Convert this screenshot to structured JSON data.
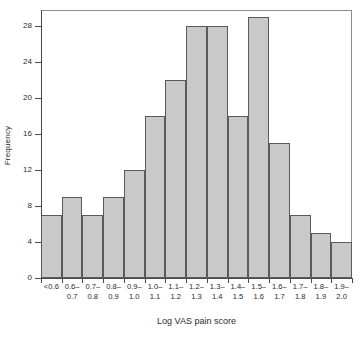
{
  "chart_data": {
    "type": "bar",
    "title": "",
    "xlabel": "Log VAS pain score",
    "ylabel": "Frequency",
    "categories": [
      "<0.6",
      "0.6-0.7",
      "0.7-0.8",
      "0.8-0.9",
      "0.9-1.0",
      "1.0-1.1",
      "1.1-1.2",
      "1.2-1.3",
      "1.3-1.4",
      "1.4-1.5",
      "1.5-1.6",
      "1.6-1.7",
      "1.7-1.8",
      "1.8-1.9",
      "1.9-2.0"
    ],
    "category_lines": [
      {
        "l1": "<0.6",
        "l2": ""
      },
      {
        "l1": "0.6–",
        "l2": "0.7"
      },
      {
        "l1": "0.7–",
        "l2": "0.8"
      },
      {
        "l1": "0.8–",
        "l2": "0.9"
      },
      {
        "l1": "0.9–",
        "l2": "1.0"
      },
      {
        "l1": "1.0–",
        "l2": "1.1"
      },
      {
        "l1": "1.1–",
        "l2": "1.2"
      },
      {
        "l1": "1.2–",
        "l2": "1.3"
      },
      {
        "l1": "1.3–",
        "l2": "1.4"
      },
      {
        "l1": "1.4–",
        "l2": "1.5"
      },
      {
        "l1": "1.5–",
        "l2": "1.6"
      },
      {
        "l1": "1.6–",
        "l2": "1.7"
      },
      {
        "l1": "1.7–",
        "l2": "1.8"
      },
      {
        "l1": "1.8–",
        "l2": "1.9"
      },
      {
        "l1": "1.9–",
        "l2": "2.0"
      }
    ],
    "values": [
      7,
      9,
      7,
      9,
      12,
      18,
      22,
      28,
      28,
      18,
      29,
      15,
      7,
      5,
      4
    ],
    "ylim": [
      0,
      29.8
    ],
    "yticks": [
      0,
      4,
      8,
      12,
      16,
      20,
      24,
      28
    ],
    "ytick_labels": [
      "0",
      "4",
      "8",
      "12",
      "16",
      "20",
      "24",
      "28"
    ],
    "grid": false,
    "legend": null,
    "bar_fill_color": "#c9c9c9",
    "bar_border_color": "#5a5a5a",
    "axis_color": "#4a4a4a",
    "background_color": "#ffffff"
  }
}
